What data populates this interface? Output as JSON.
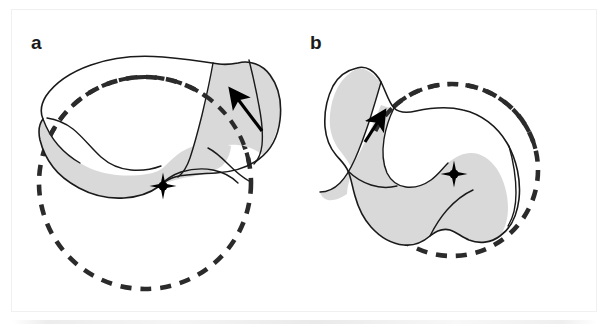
{
  "figure": {
    "type": "scientific-line-drawing",
    "background_color": "#ffffff",
    "frame_color": "#f0f0f0",
    "panel_count": 2
  },
  "style": {
    "outline_color": "#1a1a1a",
    "outline_width": 1.6,
    "fill_gray": "#d9d9d9",
    "fill_light": "#f2f2f2",
    "dash_color": "#2b2b2b",
    "dash_width": 4.6,
    "dash_pattern": "11 9",
    "marker_color": "#000000",
    "arrow_color": "#000000"
  },
  "panels": [
    {
      "id": "a",
      "label": "a",
      "label_position": {
        "x": 31,
        "y": 33
      },
      "circle": {
        "name": "best-fit-circle",
        "center_x": 145,
        "center_y": 183,
        "radius": 106,
        "stroke": "#2b2b2b",
        "dashed": true
      },
      "center_marker": {
        "name": "center-of-rotation-marker",
        "x": 163,
        "y": 186,
        "shape": "four-pointed-star-with-dot"
      },
      "arrow": {
        "name": "direction-arrow",
        "from_x": 262,
        "from_y": 131,
        "to_x": 231,
        "to_y": 90,
        "direction": "up-left"
      },
      "outline_path": "M 238,63 C 249,60 262,64 270,75 C 279,87 282,103 280,120 C 278,137 270,151 259,159 C 247,168 232,172 216,173 C 200,174 186,174 175,177 C 167,179 163,183 158,187 C 150,193 138,197 124,198 C 108,199 92,195 79,188 C 68,182 59,175 53,167 C 46,158 42,148 40,140 C 38,131 39,124 43,119 C 40,112 41,104 46,96 C 55,83 71,72 91,65 C 113,57 139,55 163,57 C 186,59 206,62 219,64 C 226,65 233,64 238,63 Z",
      "inner_paths": [
        "M 213,63 C 210,80 206,98 202,115 C 198,131 194,146 190,158 C 187,167 183,173 178,177",
        "M 47,118 C 54,119 64,122 73,129 C 83,137 92,149 101,157 C 110,165 120,169 131,170 C 142,171 153,169 161,166",
        "M 158,187 C 164,181 172,175 181,172 C 191,169 203,168 213,170 C 223,172 232,177 238,183",
        "M 249,60 C 252,72 256,89 259,106 C 262,121 263,134 262,145 C 261,154 258,160 254,164",
        "M 43,119 C 46,127 51,137 58,145 C 65,153 73,159 80,163",
        "M 208,148 C 214,151 221,157 228,164 C 235,171 242,177 249,181"
      ],
      "shaded_regions": [
        "M 43,119 C 46,127 51,137 58,145 C 65,153 73,159 80,163 C 88,168 98,172 110,174 C 122,176 135,176 147,174 C 155,173 161,170 165,166 C 170,161 175,156 181,152 C 189,147 198,144 208,143 C 216,142 224,143 231,146 C 230,155 227,161 222,166 C 214,172 202,175 189,177 C 177,179 166,182 158,187 C 150,193 138,197 124,198 C 108,199 92,195 79,188 C 68,182 59,175 53,167 C 46,158 42,148 40,140 C 38,131 39,124 43,119 Z",
        "M 213,63 C 210,80 206,98 202,115 C 198,131 194,146 190,158 C 195,156 202,153 209,150 C 218,146 228,144 238,145 C 248,146 257,150 264,156 C 270,148 276,136 279,122 C 282,105 280,88 272,76 C 265,65 252,60 240,62 C 232,63 221,64 213,63 Z"
      ]
    },
    {
      "id": "b",
      "label": "b",
      "label_position": {
        "x": 310,
        "y": 33
      },
      "circle": {
        "name": "best-fit-circle",
        "center_x": 452,
        "center_y": 170,
        "radius": 86,
        "stroke": "#2b2b2b",
        "dashed": true
      },
      "center_marker": {
        "name": "center-of-rotation-marker",
        "x": 454,
        "y": 174,
        "shape": "four-pointed-star-with-dot"
      },
      "arrow": {
        "name": "direction-arrow",
        "from_x": 365,
        "from_y": 142,
        "to_x": 384,
        "to_y": 112,
        "direction": "up-right"
      },
      "outline_path": "M 357,68 C 366,65 375,71 381,82 C 386,92 389,103 394,108 C 399,113 407,113 416,111 C 430,108 447,106 463,110 C 481,114 497,126 507,143 C 517,160 521,181 519,199 C 517,216 510,229 500,236 C 491,243 479,244 469,240 C 462,237 456,232 450,230 C 443,228 436,231 430,236 C 423,242 414,246 404,245 C 392,244 380,237 371,227 C 363,218 358,207 355,196 C 352,186 351,177 348,171 C 345,164 340,160 336,155 C 330,148 326,138 325,127 C 324,113 327,98 333,86 C 339,75 348,70 357,68 Z",
      "inner_paths": [
        "M 394,108 C 390,116 386,127 384,139 C 382,152 383,164 387,173 C 391,181 398,186 406,187 C 415,188 424,185 431,180 C 438,175 443,168 448,163",
        "M 381,82 C 378,93 374,106 370,119 C 365,134 360,148 355,159 C 350,170 345,178 340,183 C 334,189 327,192 320,192",
        "M 348,171 C 354,177 362,182 371,185 C 380,188 389,188 397,186",
        "M 430,236 C 434,228 440,218 447,210 C 455,201 464,194 473,190",
        "M 509,146 C 513,160 516,177 516,193 C 516,207 513,218 508,226"
      ],
      "shaded_regions": [
        "M 394,108 C 390,116 386,127 384,139 C 382,152 383,164 387,173 C 391,181 398,186 406,187 C 415,188 424,185 431,180 C 438,175 443,168 448,163 C 455,157 463,153 471,153 C 481,153 490,159 497,169 C 504,180 508,194 508,208 C 508,219 505,229 500,236 C 491,243 479,244 469,240 C 462,237 456,232 450,230 C 443,228 436,231 430,236 C 423,242 414,246 404,245 C 392,244 380,237 371,227 C 363,218 358,207 355,196 C 352,186 351,177 348,171 C 352,166 357,158 362,148 C 368,135 375,120 381,105 C 386,107 390,108 394,108 Z",
        "M 381,82 C 378,93 374,106 370,119 C 365,134 360,148 355,159 C 350,170 345,178 340,183 C 334,189 327,192 320,192 C 321,196 324,199 328,200 C 334,201 341,198 347,194 C 347,186 350,178 353,170 C 349,163 345,157 341,152 C 335,145 331,136 330,126 C 329,112 332,98 338,87 C 343,78 350,72 357,69 C 363,67 372,72 377,79 C 379,80 380,81 381,82 Z"
      ]
    }
  ]
}
